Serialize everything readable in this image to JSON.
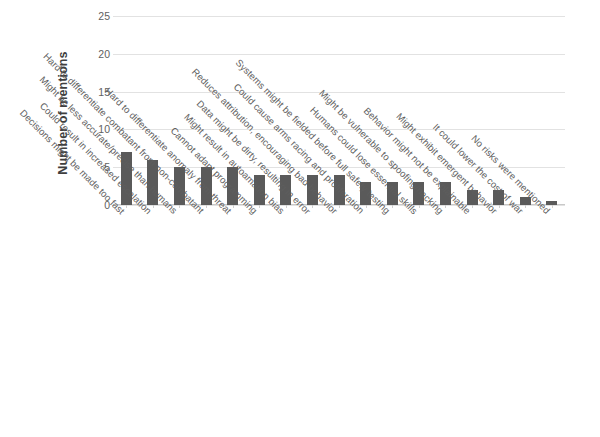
{
  "chart_data": {
    "type": "bar",
    "title": "",
    "xlabel": "",
    "ylabel": "Number of mentions",
    "ylim": [
      0,
      25
    ],
    "yticks": [
      0,
      5,
      10,
      15,
      20,
      25
    ],
    "grid": true,
    "legend": "none",
    "orientation": "vertical",
    "bar_color": "#5a5a5a",
    "categories": [
      "Decisions might be made too fast",
      "Could result in increased escalation",
      "Might be less accurate/precise than humans",
      "Hard to differentiate combatant from non-combatant",
      "Hard to differentiate anomaly from threat",
      "Cannot adapt programming",
      "Might result in autoamation bias",
      "Data might be dirty, resulting in error",
      "Reduces attribution, encouraging bad behavior",
      "Could cause arms racing and proliferation",
      "Systems might be fielded before full safety testing",
      "Humans could lose essential skills",
      "Might be vulnerable to spoofing/hacking",
      "Behavior might not be explainable",
      "Might exhibit emergent behavior",
      "It could lower the cost of war",
      "No risks were mentioned"
    ],
    "values": [
      7,
      6,
      5,
      5,
      5,
      4,
      4,
      4,
      4,
      3,
      3,
      3,
      3,
      2,
      2,
      1,
      0.5
    ]
  },
  "axes": {
    "y_title": "Number of mentions",
    "y_tick_labels": [
      "0",
      "5",
      "10",
      "15",
      "20",
      "25"
    ]
  },
  "colors": {
    "bar": "#5a5a5a",
    "gridline": "#e2e2e2",
    "text": "#5e5e5e",
    "background": "#ffffff"
  }
}
